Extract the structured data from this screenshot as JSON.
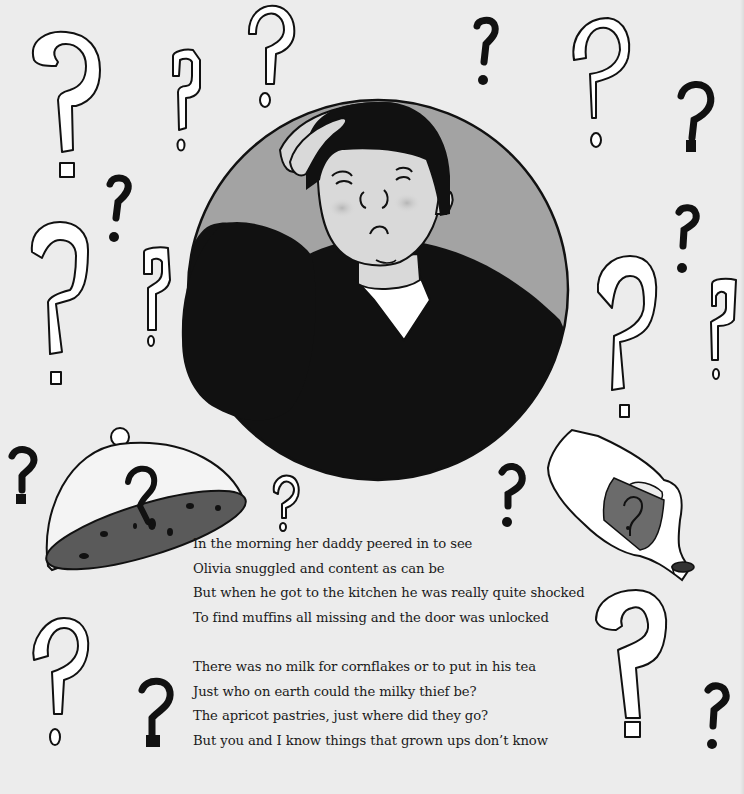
{
  "page": {
    "background": "#ececec",
    "colors": {
      "ink": "#111111",
      "circle_fill": "#a3a3a3",
      "skin": "#d9d9d9",
      "jacket": "#111111",
      "shirt": "#ffffff",
      "cake": "#5a5a5a",
      "label": "#6b6b6b"
    }
  },
  "illustration": {
    "main_figure": "daddy-scratching-head",
    "objects": [
      "cake-dome-cover",
      "tipped-milk-bottle",
      "bottle-cap"
    ],
    "decorations": "scattered-question-marks",
    "dome_mark": "?",
    "bottle_label_mark": "?"
  },
  "verse": {
    "stanza_1": [
      "In the morning her daddy peered in to see",
      "Olivia snuggled and content as can be",
      "But when he got to the kitchen he was really quite shocked",
      "To find muffins all missing and the door was unlocked"
    ],
    "stanza_2": [
      "There was no milk for cornflakes or to put in his tea",
      "Just who on earth could the milky thief be?",
      "The apricot pastries, just where did they go?",
      "But you and I know things that grown ups don’t know"
    ]
  }
}
